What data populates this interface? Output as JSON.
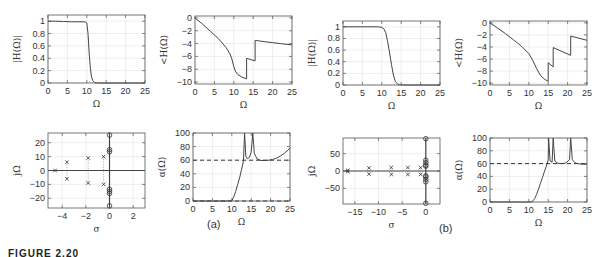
{
  "figure": {
    "caption": "FIGURE 2.20",
    "panel_labels": [
      "(a)",
      "(b)"
    ]
  },
  "chart_data": [
    {
      "id": "a-mag",
      "type": "line",
      "panel": "(a)",
      "xlabel": "Ω",
      "ylabel": "|H(Ω)|",
      "xlim": [
        0,
        25
      ],
      "ylim": [
        0,
        1.1
      ],
      "xticks": [
        0,
        5,
        10,
        15,
        20,
        25
      ],
      "yticks": [
        0,
        0.2,
        0.4,
        0.6,
        0.8,
        1
      ],
      "ytick_labels": [
        "0",
        "0.2",
        "0.4",
        "0.6",
        "0.8",
        "1"
      ],
      "grid": true,
      "series": [
        {
          "name": "magnitude",
          "x": [
            0,
            2,
            4,
            6,
            8,
            9.5,
            10,
            10.3,
            10.6,
            10.9,
            11.2,
            11.5,
            12,
            12.5,
            13,
            25
          ],
          "y": [
            1,
            1,
            0.995,
            0.99,
            0.99,
            0.99,
            0.97,
            0.8,
            0.5,
            0.25,
            0.1,
            0.04,
            0.01,
            0.003,
            0,
            0
          ]
        }
      ]
    },
    {
      "id": "a-phase",
      "type": "line",
      "panel": "(a)",
      "xlabel": "Ω",
      "ylabel": "<H(Ω)",
      "xlim": [
        0,
        25
      ],
      "ylim": [
        -10.3,
        0.3
      ],
      "xticks": [
        0,
        5,
        10,
        15,
        20,
        25
      ],
      "yticks": [
        0,
        -2,
        -4,
        -6,
        -8,
        -10
      ],
      "grid": true,
      "series": [
        {
          "name": "phase",
          "x": [
            0,
            2,
            4,
            6,
            8,
            9,
            9.5,
            10,
            10.5,
            11,
            12,
            13.3,
            13.3,
            15.5,
            15.5,
            18,
            20,
            22,
            25
          ],
          "y": [
            0,
            -1,
            -2.1,
            -3.2,
            -4.6,
            -5.6,
            -6.4,
            -7.6,
            -8.4,
            -8.8,
            -9.2,
            -9.5,
            -6.3,
            -6.7,
            -3.5,
            -3.7,
            -3.85,
            -4.0,
            -4.2
          ]
        }
      ]
    },
    {
      "id": "a-pz",
      "type": "scatter",
      "panel": "(a)",
      "xlabel": "σ",
      "ylabel": "jΩ",
      "xlim": [
        -5.2,
        3
      ],
      "ylim": [
        -27,
        27
      ],
      "xticks": [
        -4,
        -2,
        0,
        2
      ],
      "yticks": [
        20,
        10,
        0,
        -10,
        -20
      ],
      "grid": true,
      "poles": [
        [
          -4.6,
          0
        ],
        [
          -3.6,
          6
        ],
        [
          -3.6,
          -6
        ],
        [
          -1.8,
          9
        ],
        [
          -1.8,
          -9
        ],
        [
          -0.5,
          10
        ],
        [
          -0.5,
          -10
        ]
      ],
      "zeros": [
        [
          0,
          25.5
        ],
        [
          0,
          15
        ],
        [
          0,
          13.5
        ],
        [
          0,
          -13.5
        ],
        [
          0,
          -15
        ],
        [
          0,
          -16.5
        ],
        [
          0,
          -25.5
        ]
      ]
    },
    {
      "id": "a-atten",
      "type": "line",
      "panel": "(a)",
      "xlabel": "Ω",
      "ylabel": "α(Ω)",
      "xlim": [
        0,
        25
      ],
      "ylim": [
        0,
        100
      ],
      "xticks": [
        0,
        5,
        10,
        15,
        20,
        25
      ],
      "yticks": [
        0,
        20,
        40,
        60,
        80,
        100
      ],
      "grid": true,
      "reference_lines": [
        60,
        0
      ],
      "series": [
        {
          "name": "attenuation",
          "x": [
            0,
            10,
            10.5,
            11,
            11.5,
            12,
            12.5,
            13,
            13.3,
            13.3,
            13.6,
            14,
            14.5,
            15,
            15.4,
            15.4,
            15.8,
            16.5,
            17.5,
            18.5,
            19.5,
            20.5,
            21.5,
            22.5,
            23.5,
            24.5,
            25
          ],
          "y": [
            0,
            0,
            6,
            14,
            24,
            34,
            46,
            58,
            100,
            100,
            66,
            62,
            64,
            72,
            100,
            100,
            70,
            62,
            59.5,
            59.5,
            60,
            61,
            63,
            66,
            70,
            75,
            78
          ]
        }
      ]
    },
    {
      "id": "b-mag",
      "type": "line",
      "panel": "(b)",
      "xlabel": "Ω",
      "ylabel": "|H(Ω)|",
      "xlim": [
        0,
        25
      ],
      "ylim": [
        0,
        1.1
      ],
      "xticks": [
        0,
        5,
        10,
        15,
        20,
        25
      ],
      "yticks": [
        0,
        0.2,
        0.4,
        0.6,
        0.8,
        1
      ],
      "ytick_labels": [
        "0",
        "0.2",
        "0.4",
        "0.6",
        "0.8",
        "1"
      ],
      "grid": true,
      "series": [
        {
          "name": "magnitude",
          "x": [
            0,
            5,
            9,
            10,
            10.5,
            11,
            11.5,
            12,
            12.5,
            13,
            13.5,
            14,
            14.5,
            15,
            25
          ],
          "y": [
            1,
            1,
            1,
            0.99,
            0.97,
            0.9,
            0.75,
            0.55,
            0.35,
            0.17,
            0.06,
            0.02,
            0.005,
            0,
            0
          ]
        }
      ]
    },
    {
      "id": "b-phase",
      "type": "line",
      "panel": "(b)",
      "xlabel": "Ω",
      "ylabel": "<H(Ω)",
      "xlim": [
        0,
        25
      ],
      "ylim": [
        -10.3,
        0.3
      ],
      "xticks": [
        0,
        5,
        10,
        15,
        20,
        25
      ],
      "yticks": [
        0,
        -2,
        -4,
        -6,
        -8,
        -10
      ],
      "grid": true,
      "series": [
        {
          "name": "phase",
          "x": [
            0,
            2,
            4,
            6,
            8,
            10,
            11,
            12,
            13,
            14,
            15,
            15,
            16.3,
            16.3,
            20.8,
            20.8,
            25
          ],
          "y": [
            0,
            -0.9,
            -1.8,
            -2.8,
            -3.8,
            -5.1,
            -6.2,
            -7.6,
            -8.7,
            -9.3,
            -9.7,
            -6.6,
            -7.3,
            -4.1,
            -5.4,
            -2.2,
            -2.9
          ]
        }
      ]
    },
    {
      "id": "b-pz",
      "type": "scatter",
      "panel": "(b)",
      "xlabel": "σ",
      "ylabel": "jΩ",
      "xlim": [
        -17.5,
        3
      ],
      "ylim": [
        -95,
        95
      ],
      "xticks": [
        -15,
        -10,
        -5,
        0
      ],
      "yticks": [
        50,
        0,
        -50
      ],
      "grid": true,
      "poles": [
        [
          -16.5,
          2
        ],
        [
          -16.5,
          -2
        ],
        [
          -12,
          9
        ],
        [
          -12,
          -9
        ],
        [
          -7.3,
          10
        ],
        [
          -7.3,
          -10
        ],
        [
          -3.8,
          10
        ],
        [
          -3.8,
          -10
        ],
        [
          -1.1,
          10
        ],
        [
          -1.1,
          -10
        ]
      ],
      "zeros": [
        [
          0,
          93
        ],
        [
          0,
          31
        ],
        [
          0,
          24
        ],
        [
          0,
          17
        ],
        [
          0,
          14
        ],
        [
          0,
          -14
        ],
        [
          0,
          -17
        ],
        [
          0,
          -24
        ],
        [
          0,
          -31
        ],
        [
          0,
          -93
        ]
      ]
    },
    {
      "id": "b-atten",
      "type": "line",
      "panel": "(b)",
      "xlabel": "Ω",
      "ylabel": "α(Ω)",
      "xlim": [
        0,
        25
      ],
      "ylim": [
        0,
        100
      ],
      "xticks": [
        0,
        5,
        10,
        15,
        20,
        25
      ],
      "yticks": [
        0,
        20,
        40,
        60,
        80,
        100
      ],
      "grid": true,
      "reference_lines": [
        60
      ],
      "series": [
        {
          "name": "attenuation",
          "x": [
            0,
            10.8,
            11.5,
            12,
            12.5,
            13,
            13.5,
            14,
            14.5,
            15,
            15.1,
            15.1,
            15.5,
            16,
            16.3,
            16.3,
            16.7,
            17.5,
            18.5,
            19.5,
            20.5,
            20.8,
            20.8,
            21.2,
            22,
            23,
            24,
            25
          ],
          "y": [
            0,
            0,
            5,
            12,
            20,
            29,
            38,
            47,
            56,
            66,
            100,
            100,
            64,
            62,
            100,
            100,
            64,
            60.5,
            60,
            61,
            66,
            100,
            100,
            66,
            61,
            59.5,
            59,
            59
          ]
        }
      ]
    }
  ]
}
